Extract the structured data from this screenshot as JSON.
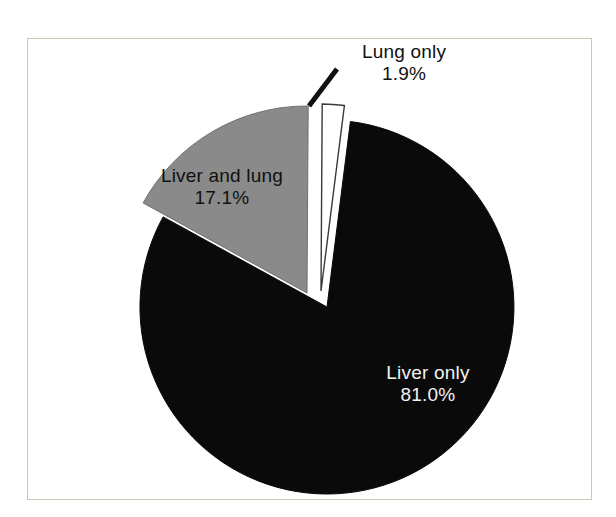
{
  "chart_data": {
    "type": "pie",
    "title": "",
    "subtitle": "",
    "xlabel": "",
    "ylabel": "",
    "legend_position": "none",
    "grid": false,
    "labels_on_slices": true,
    "categories": [
      "Liver only",
      "Liver and lung",
      "Lung only"
    ],
    "values": [
      81.0,
      17.1,
      1.9
    ],
    "units": "%",
    "slices": [
      {
        "label": "Liver only",
        "value": 81.0,
        "value_text": "81.0%",
        "color": "#0a0a0a",
        "text_color": "#f2f2f2",
        "exploded": false,
        "has_leader_line": false
      },
      {
        "label": "Liver and lung",
        "value": 17.1,
        "value_text": "17.1%",
        "color": "#8a8a8a",
        "text_color": "#111111",
        "exploded": true,
        "has_leader_line": false
      },
      {
        "label": "Lung only",
        "value": 1.9,
        "value_text": "1.9%",
        "color": "#ffffff",
        "text_color": "#111111",
        "exploded": true,
        "has_leader_line": true
      }
    ]
  },
  "frame": {
    "border_color": "#c4ccba",
    "background": "#ffffff"
  },
  "labels": {
    "lung_only": {
      "name": "Lung only",
      "value": "1.9%"
    },
    "liver_and_lung": {
      "name": "Liver and lung",
      "value": "17.1%"
    },
    "liver_only": {
      "name": "Liver only",
      "value": "81.0%"
    }
  }
}
